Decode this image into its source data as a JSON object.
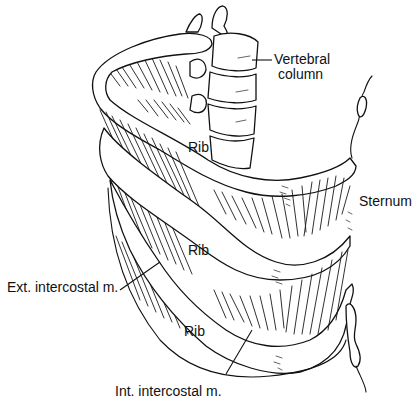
{
  "figure": {
    "background": "#ffffff",
    "line_color": "#111111"
  },
  "labels": {
    "vertebral_line1": "Vertebral",
    "vertebral_line2": "column",
    "sternum": "Sternum",
    "rib_upper": "Rib",
    "rib_middle": "Rib",
    "rib_lower": "Rib",
    "ext_intercostal": "Ext. intercostal m.",
    "int_intercostal": "Int. intercostal m."
  }
}
